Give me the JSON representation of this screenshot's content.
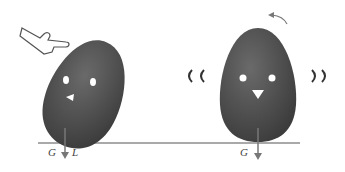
{
  "figure": {
    "left_egg": {
      "labels": {
        "G": "G",
        "L": "L"
      },
      "state": "tilted, pushed by finger"
    },
    "right_egg": {
      "labels": {
        "G": "G"
      },
      "state": "upright, wobbling"
    },
    "colors": {
      "egg": "#5a5a5a",
      "egg_shadow": "#3f3f3f",
      "ground": "#555555",
      "arrow": "#777777"
    }
  }
}
